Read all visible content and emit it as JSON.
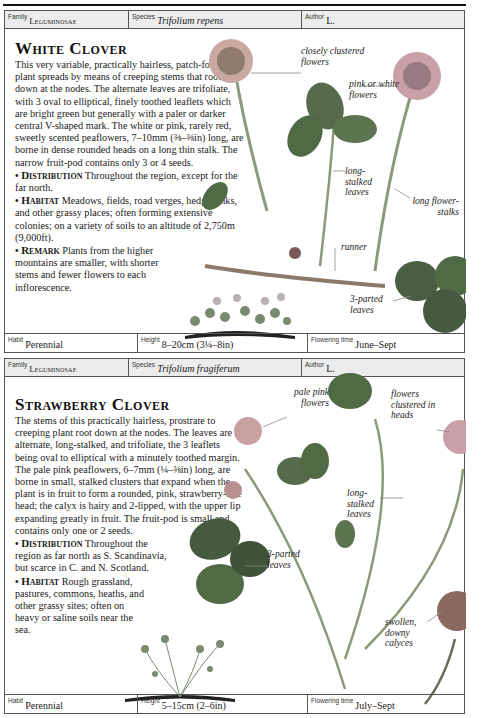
{
  "entries": [
    {
      "header": {
        "family_label": "Family",
        "family": "Leguminosae",
        "species_label": "Species",
        "species": "Trifolium repens",
        "author_label": "Author",
        "author": "L."
      },
      "title": "White Clover",
      "description": "This very variable, practically hairless, patch-forming plant spreads by means of creeping stems that root down at the nodes. The alternate leaves are trifoliate, with 3 oval to elliptical, finely toothed leaflets which are bright green but generally with a paler or darker central V-shaped mark. The white or pink, rarely red, sweetly scented peaflowers, 7–10mm (⅜–⅜in) long, are borne in dense rounded heads on a long thin stalk. The narrow fruit-pod contains only 3 or 4 seeds.",
      "sections": [
        {
          "heading": "Distribution",
          "text": "Throughout the region, except for the far north."
        },
        {
          "heading": "Habitat",
          "text": "Meadows, fields, road verges, hedgebanks, and other grassy places; often forming extensive colonies; on a variety of soils to an altitude of 2,750m (9,000ft)."
        },
        {
          "heading": "Remark",
          "text": "Plants from the higher mountains are smaller, with shorter stems and fewer flowers to each inflorescence."
        }
      ],
      "annotations": [
        "closely clustered flowers",
        "pink or white flowers",
        "long-stalked leaves",
        "long flower-stalks",
        "runner",
        "3-parted leaves"
      ],
      "footer": {
        "habit_label": "Habit",
        "habit": "Perennial",
        "height_label": "Height",
        "height": "8–20cm (3¼–8in)",
        "flowering_label": "Flowering time",
        "flowering": "June–Sept"
      }
    },
    {
      "header": {
        "family_label": "Family",
        "family": "Leguminosae",
        "species_label": "Species",
        "species": "Trifolium fragiferum",
        "author_label": "Author",
        "author": "L."
      },
      "title": "Strawberry Clover",
      "description": "The stems of this practically hairless, prostrate to creeping plant root down at the nodes. The leaves are alternate, long-stalked, and trifoliate, the 3 leaflets being oval to elliptical with a minutely toothed margin. The pale pink peaflowers, 6–7mm (¼–⅜in) long, are borne in small, stalked clusters that expand when the plant is in fruit to form a rounded, pink, strawberry-like head; the calyx is hairy and 2-lipped, with the upper lip expanding greatly in fruit. The fruit-pod is small and contains only one or 2 seeds.",
      "sections": [
        {
          "heading": "Distribution",
          "text": "Throughout the region as far north as S. Scandinavia, but scarce in C. and N. Scotland."
        },
        {
          "heading": "Habitat",
          "text": "Rough grassland, pastures, commons, heaths, and other grassy sites; often on heavy or saline soils near the sea."
        }
      ],
      "annotations": [
        "pale pink flowers",
        "flowers clustered in heads",
        "long-stalked leaves",
        "3-parted leaves",
        "swollen, downy calyces"
      ],
      "footer": {
        "habit_label": "Habit",
        "habit": "Perennial",
        "height_label": "Height",
        "height": "5–15cm (2–6in)",
        "flowering_label": "Flowering time",
        "flowering": "July–Sept"
      }
    }
  ],
  "colors": {
    "header_bg": "#ececec",
    "border": "#555555",
    "leaf_green": "#4f6a45",
    "flower_pink": "#c9a0a8"
  }
}
